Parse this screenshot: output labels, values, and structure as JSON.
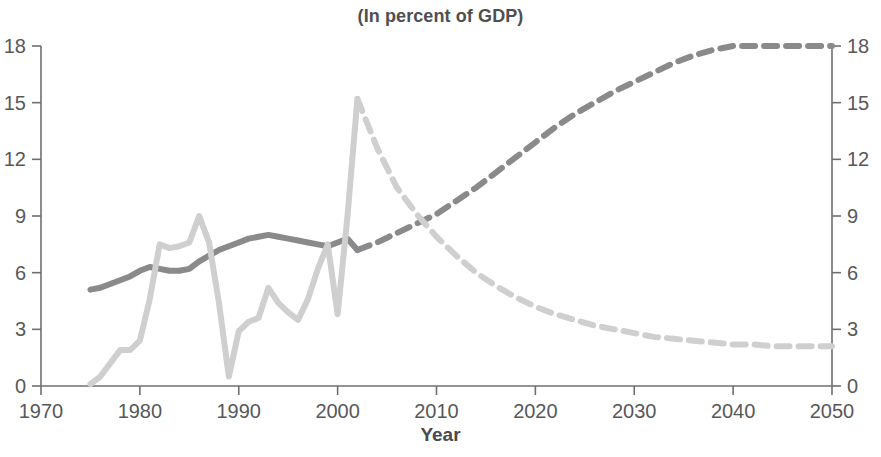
{
  "chart": {
    "title": "(In percent of GDP)",
    "xlabel": "Year",
    "ylabel": ""
  },
  "axes": {
    "x_ticks": [
      "1970",
      "1980",
      "1990",
      "2000",
      "2010",
      "2020",
      "2030",
      "2040",
      "2050"
    ],
    "y_ticks_left": [
      "0",
      "3",
      "6",
      "9",
      "12",
      "15",
      "18"
    ],
    "y_ticks_right": [
      "0",
      "3",
      "6",
      "9",
      "12",
      "15",
      "18"
    ]
  },
  "colors": {
    "series_dark": "#8a8a8c",
    "series_light": "#cfcfcf",
    "axis": "#6f6f71",
    "text": "#58585a",
    "background": "#ffffff"
  },
  "chart_data": {
    "type": "line",
    "title": "(In percent of GDP)",
    "xlabel": "Year",
    "ylabel": "",
    "xlim": [
      1970,
      2050
    ],
    "ylim": [
      0,
      18
    ],
    "xticks": [
      1970,
      1980,
      1990,
      2000,
      2010,
      2020,
      2030,
      2040,
      2050
    ],
    "yticks": [
      0,
      3,
      6,
      9,
      12,
      15,
      18
    ],
    "grid": false,
    "legend": "none",
    "dual_axis": true,
    "right_axis_same_scale": true,
    "projection_starts": 2002,
    "series": [
      {
        "name": "series-dark",
        "color": "#8a8a8c",
        "linewidth": 6,
        "historical_style": "solid",
        "projection_style": "dashed",
        "x": [
          1975,
          1976,
          1977,
          1978,
          1979,
          1980,
          1981,
          1982,
          1983,
          1984,
          1985,
          1986,
          1987,
          1988,
          1989,
          1990,
          1991,
          1992,
          1993,
          1994,
          1995,
          1996,
          1997,
          1998,
          1999,
          2000,
          2001,
          2002,
          2004,
          2006,
          2008,
          2010,
          2012,
          2014,
          2016,
          2018,
          2020,
          2022,
          2024,
          2026,
          2028,
          2030,
          2032,
          2034,
          2036,
          2038,
          2040,
          2042,
          2044,
          2046,
          2048,
          2050
        ],
        "y": [
          5.1,
          5.2,
          5.4,
          5.6,
          5.8,
          6.1,
          6.3,
          6.2,
          6.1,
          6.1,
          6.2,
          6.6,
          6.9,
          7.2,
          7.4,
          7.6,
          7.8,
          7.9,
          8.0,
          7.9,
          7.8,
          7.7,
          7.6,
          7.5,
          7.4,
          7.6,
          7.8,
          7.2,
          7.6,
          8.1,
          8.6,
          9.1,
          9.8,
          10.5,
          11.3,
          12.1,
          12.9,
          13.7,
          14.4,
          15.0,
          15.6,
          16.1,
          16.6,
          17.1,
          17.5,
          17.8,
          18.0,
          18.0,
          18.0,
          18.0,
          18.0,
          18.0
        ]
      },
      {
        "name": "series-light",
        "color": "#cfcfcf",
        "linewidth": 6,
        "historical_style": "solid",
        "projection_style": "dashed",
        "x": [
          1975,
          1976,
          1977,
          1978,
          1979,
          1980,
          1981,
          1982,
          1983,
          1984,
          1985,
          1986,
          1987,
          1988,
          1989,
          1990,
          1991,
          1992,
          1993,
          1994,
          1995,
          1996,
          1997,
          1998,
          1999,
          2000,
          2001,
          2002,
          2004,
          2006,
          2008,
          2010,
          2012,
          2014,
          2016,
          2018,
          2020,
          2022,
          2024,
          2026,
          2028,
          2030,
          2032,
          2034,
          2036,
          2038,
          2040,
          2042,
          2044,
          2046,
          2048,
          2050
        ],
        "y": [
          0.1,
          0.5,
          1.2,
          1.9,
          1.9,
          2.4,
          4.6,
          7.5,
          7.3,
          7.4,
          7.6,
          9.0,
          7.6,
          4.4,
          0.5,
          2.9,
          3.4,
          3.6,
          5.2,
          4.4,
          3.9,
          3.5,
          4.6,
          6.2,
          7.5,
          3.8,
          9.0,
          15.2,
          12.6,
          10.5,
          9.1,
          7.9,
          6.9,
          6.0,
          5.3,
          4.7,
          4.2,
          3.8,
          3.5,
          3.2,
          3.0,
          2.8,
          2.6,
          2.5,
          2.4,
          2.3,
          2.2,
          2.2,
          2.1,
          2.1,
          2.1,
          2.1
        ]
      }
    ]
  }
}
